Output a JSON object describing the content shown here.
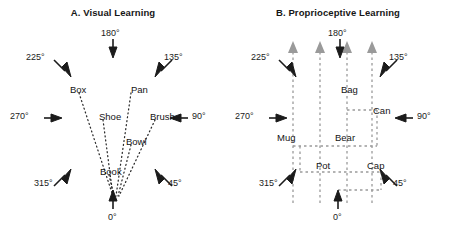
{
  "figure": {
    "width": 451,
    "height": 232,
    "background": "#ffffff",
    "panels": [
      {
        "id": "A",
        "title": "A.  Visual Learning",
        "style": "radial-fan",
        "line_color": "#2b2b2b",
        "line_style": "dotted",
        "origin_deg": "0",
        "object_labels": [
          {
            "text": "Box",
            "x": 70,
            "y": 84
          },
          {
            "text": "Pan",
            "x": 131,
            "y": 84
          },
          {
            "text": "Shoe",
            "x": 99,
            "y": 111
          },
          {
            "text": "Brush",
            "x": 150,
            "y": 111
          },
          {
            "text": "Bowl",
            "x": 126,
            "y": 136
          },
          {
            "text": "Book",
            "x": 100,
            "y": 166
          }
        ],
        "direction_labels": [
          {
            "deg": "180°",
            "arrow": "down",
            "x": 101,
            "y": 28
          },
          {
            "deg": "225°",
            "arrow": "down-right",
            "x": 26,
            "y": 52
          },
          {
            "deg": "135°",
            "arrow": "down-left",
            "x": 164,
            "y": 52
          },
          {
            "deg": "270°",
            "arrow": "right",
            "x": 10,
            "y": 115
          },
          {
            "deg": "90°",
            "arrow": "left",
            "x": 192,
            "y": 115
          },
          {
            "deg": "315°",
            "arrow": "up-right",
            "x": 34,
            "y": 178
          },
          {
            "deg": "45°",
            "arrow": "up-left",
            "x": 168,
            "y": 178
          },
          {
            "deg": "0°",
            "arrow": "up",
            "x": 108,
            "y": 214
          }
        ]
      },
      {
        "id": "B",
        "title": "B.  Proprioceptive Learning",
        "style": "orthogonal-paths",
        "line_color": "#9a9a9a",
        "line_style": "dashed",
        "origin_deg": "0",
        "arrowhead_count": 4,
        "object_labels": [
          {
            "text": "Bag",
            "x": 116,
            "y": 84
          },
          {
            "text": "Can",
            "x": 144,
            "y": 110
          },
          {
            "text": "Mug",
            "x": 62,
            "y": 136
          },
          {
            "text": "Bear",
            "x": 113,
            "y": 136
          },
          {
            "text": "Pot",
            "x": 92,
            "y": 166
          },
          {
            "text": "Cap",
            "x": 143,
            "y": 166
          }
        ],
        "direction_labels": [
          {
            "deg": "180°",
            "arrow": "down",
            "x": 101,
            "y": 28
          },
          {
            "deg": "225°",
            "arrow": "down-right",
            "x": 26,
            "y": 52
          },
          {
            "deg": "135°",
            "arrow": "down-left",
            "x": 164,
            "y": 52
          },
          {
            "deg": "270°",
            "arrow": "right",
            "x": 10,
            "y": 115
          },
          {
            "deg": "90°",
            "arrow": "left",
            "x": 192,
            "y": 115
          },
          {
            "deg": "315°",
            "arrow": "up-right",
            "x": 34,
            "y": 178
          },
          {
            "deg": "45°",
            "arrow": "up-left",
            "x": 168,
            "y": 178
          },
          {
            "deg": "0°",
            "arrow": "up",
            "x": 108,
            "y": 214
          }
        ]
      }
    ]
  }
}
